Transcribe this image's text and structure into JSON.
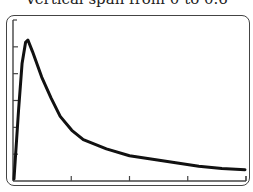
{
  "caption": "Vertical span from 0 to 0.6",
  "chart_data": {
    "type": "line",
    "title": "Vertical span from 0 to 0.6",
    "xlabel": "",
    "ylabel": "",
    "ylim": [
      0,
      0.6
    ],
    "x_ticks": 4,
    "y_ticks": 6,
    "grid": false,
    "series": [
      {
        "name": "curve",
        "points": [
          [
            0.0,
            0.0
          ],
          [
            0.02,
            0.3
          ],
          [
            0.035,
            0.5
          ],
          [
            0.05,
            0.59
          ],
          [
            0.06,
            0.6
          ],
          [
            0.08,
            0.55
          ],
          [
            0.12,
            0.44
          ],
          [
            0.16,
            0.35
          ],
          [
            0.2,
            0.27
          ],
          [
            0.25,
            0.21
          ],
          [
            0.3,
            0.17
          ],
          [
            0.4,
            0.13
          ],
          [
            0.5,
            0.1
          ],
          [
            0.6,
            0.085
          ],
          [
            0.7,
            0.07
          ],
          [
            0.8,
            0.055
          ],
          [
            0.9,
            0.045
          ],
          [
            1.0,
            0.04
          ]
        ]
      }
    ]
  },
  "colors": {
    "curve": "#111111",
    "axis": "#444444",
    "frame": "#444444"
  }
}
